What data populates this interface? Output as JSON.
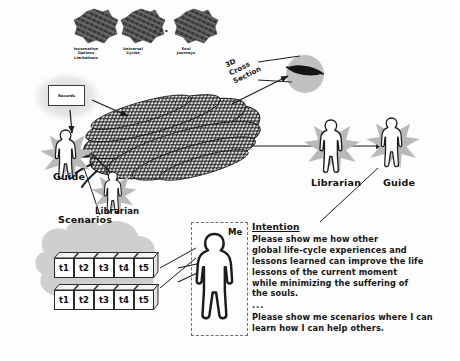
{
  "diagram": {
    "background_color": "#fdfdfd",
    "ink_color": "#111111",
    "shadow_color": "#c9c9c9",
    "strand_color": "#2b2b2b"
  },
  "clusters": {
    "separator": "...",
    "items": [
      {
        "label": "Incarnation\nOptions\nLimitations"
      },
      {
        "label": "Universal\nCycles"
      },
      {
        "label": "Soul\nJourneys"
      }
    ]
  },
  "braid": {
    "name": "soul-strand-bundle",
    "cross_section_label": "3D\nCross\nSection"
  },
  "records": {
    "label": "Records"
  },
  "figures": [
    {
      "name": "guide-left",
      "label": "Guide"
    },
    {
      "name": "librarian-left",
      "label": "Librarian"
    },
    {
      "name": "librarian-right",
      "label": "Librarian"
    },
    {
      "name": "guide-right",
      "label": "Guide"
    },
    {
      "name": "me",
      "label": "Me"
    }
  ],
  "scenarios": {
    "label": "Scenarios",
    "rows": [
      [
        "t1",
        "t2",
        "t3",
        "t4",
        "t5"
      ],
      [
        "t1",
        "t2",
        "t3",
        "t4",
        "t5"
      ]
    ]
  },
  "intention": {
    "title": "Intention",
    "paragraph1": "Please show me how other\nglobal life-cycle experiences and\nlessons learned can improve the life\nlessons of the current moment\nwhile minimizing the suffering of\nthe souls.",
    "ellipsis": "...",
    "paragraph2": "Please show me scenarios where I can\nlearn how I can help others."
  }
}
